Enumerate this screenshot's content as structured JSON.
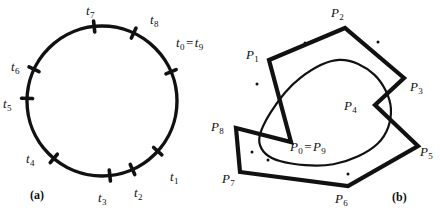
{
  "figure": {
    "width": 440,
    "height": 216,
    "background": "#ffffff",
    "ink_color": "#111111",
    "panels": [
      {
        "key": "a",
        "caption": "(a)",
        "caption_x": 30,
        "caption_y": 188
      },
      {
        "key": "b",
        "caption": "(b)",
        "caption_x": 392,
        "caption_y": 190
      }
    ]
  },
  "panel_a": {
    "description": "circle-with-knot-ticks",
    "circle": {
      "cx": 102,
      "cy": 101,
      "r": 75,
      "stroke_width": 3.4
    },
    "tick": {
      "length": 11,
      "stroke_width": 3.6
    },
    "knots": [
      {
        "id": "t0",
        "label": "t",
        "sub": "0",
        "angle_deg": -23,
        "label_x": 176,
        "label_y": 36,
        "combined": true
      },
      {
        "id": "t1",
        "label": "t",
        "sub": "1",
        "angle_deg": 42,
        "label_x": 170,
        "label_y": 170
      },
      {
        "id": "t2",
        "label": "t",
        "sub": "2",
        "angle_deg": 66,
        "label_x": 134,
        "label_y": 186
      },
      {
        "id": "t3",
        "label": "t",
        "sub": "3",
        "angle_deg": 84,
        "label_x": 98,
        "label_y": 191
      },
      {
        "id": "t4",
        "label": "t",
        "sub": "4",
        "angle_deg": 130,
        "label_x": 26,
        "label_y": 152
      },
      {
        "id": "t5",
        "label": "t",
        "sub": "5",
        "angle_deg": 182,
        "label_x": 3,
        "label_y": 97
      },
      {
        "id": "t6",
        "label": "t",
        "sub": "6",
        "angle_deg": 205,
        "label_x": 11,
        "label_y": 60
      },
      {
        "id": "t7",
        "label": "t",
        "sub": "7",
        "angle_deg": 264,
        "label_x": 86,
        "label_y": 4
      },
      {
        "id": "t8",
        "label": "t",
        "sub": "8",
        "angle_deg": -65,
        "label_x": 150,
        "label_y": 13
      }
    ],
    "combined_label": {
      "id": "t0-eq-t9",
      "left": "t",
      "left_sub": "0",
      "equals": "=",
      "right": "t",
      "right_sub": "9",
      "x": 176,
      "y": 36
    }
  },
  "panel_b": {
    "description": "control-polygon-with-closed-spline-curve",
    "polygon_stroke_width": 4.2,
    "curve_stroke_width": 2.2,
    "control_points": [
      {
        "id": "P0",
        "label": "P",
        "sub": "0",
        "x": 291,
        "y": 142,
        "label_x": 290,
        "label_y": 140,
        "combined": true
      },
      {
        "id": "P1",
        "label": "P",
        "sub": "1",
        "x": 269,
        "y": 60,
        "label_x": 246,
        "label_y": 48
      },
      {
        "id": "P2",
        "label": "P",
        "sub": "2",
        "x": 345,
        "y": 28,
        "label_x": 331,
        "label_y": 6
      },
      {
        "id": "P3",
        "label": "P",
        "sub": "3",
        "x": 404,
        "y": 78,
        "label_x": 410,
        "label_y": 80
      },
      {
        "id": "P4",
        "label": "P",
        "sub": "4",
        "x": 375,
        "y": 105,
        "label_x": 344,
        "label_y": 99
      },
      {
        "id": "P5",
        "label": "P",
        "sub": "5",
        "x": 418,
        "y": 146,
        "label_x": 420,
        "label_y": 145
      },
      {
        "id": "P6",
        "label": "P",
        "sub": "6",
        "x": 348,
        "y": 186,
        "label_x": 335,
        "label_y": 192
      },
      {
        "id": "P7",
        "label": "P",
        "sub": "7",
        "x": 240,
        "y": 172,
        "label_x": 222,
        "label_y": 172
      },
      {
        "id": "P8",
        "label": "P",
        "sub": "8",
        "x": 236,
        "y": 128,
        "label_x": 211,
        "label_y": 120
      }
    ],
    "combined_label": {
      "id": "P0-eq-P9",
      "left": "P",
      "left_sub": "0",
      "equals": "=",
      "right": "P",
      "right_sub": "9",
      "x": 290,
      "y": 140
    },
    "polygon_order": [
      "P0",
      "P1",
      "P2",
      "P3",
      "P4",
      "P5",
      "P6",
      "P7",
      "P8",
      "P0"
    ],
    "curve_knot_dots": [
      {
        "x": 305,
        "y": 43
      },
      {
        "x": 378,
        "y": 42
      },
      {
        "x": 257,
        "y": 84
      },
      {
        "x": 268,
        "y": 160
      },
      {
        "x": 252,
        "y": 152
      },
      {
        "x": 348,
        "y": 174
      }
    ]
  }
}
